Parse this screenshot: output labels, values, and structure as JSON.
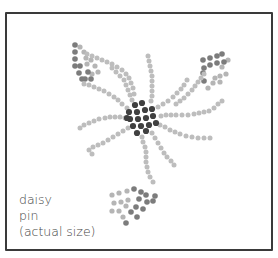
{
  "caption": {
    "line1": "daisy",
    "line2": "pin",
    "line3": "(actual size)"
  },
  "colors": {
    "border": "#3a3a3a",
    "center_bead": "#404040",
    "petal_bead": "#bdbdbd",
    "leaf_dark": "#7c7c7c",
    "leaf_light": "#b5b5b5",
    "text": "#444444"
  },
  "design": {
    "center": {
      "beads": [
        [
          135,
          105
        ],
        [
          142,
          103
        ],
        [
          129,
          112
        ],
        [
          137,
          112
        ],
        [
          145,
          110
        ],
        [
          152,
          109
        ],
        [
          130,
          119
        ],
        [
          138,
          119
        ],
        [
          146,
          118
        ],
        [
          153,
          116
        ],
        [
          133,
          126
        ],
        [
          141,
          126
        ],
        [
          149,
          125
        ],
        [
          156,
          123
        ],
        [
          137,
          133
        ],
        [
          146,
          131
        ],
        [
          127,
          118
        ]
      ]
    },
    "petals": [
      {
        "name": "petal-upper-left",
        "beads": [
          [
            127,
            108
          ],
          [
            122,
            104
          ],
          [
            118,
            100
          ],
          [
            114,
            97
          ],
          [
            109,
            94
          ],
          [
            104,
            91
          ],
          [
            99,
            89
          ],
          [
            94,
            87
          ],
          [
            89,
            85
          ],
          [
            84,
            84
          ]
        ]
      },
      {
        "name": "petal-left",
        "beads": [
          [
            125,
            118
          ],
          [
            120,
            117
          ],
          [
            115,
            117
          ],
          [
            110,
            117
          ],
          [
            105,
            118
          ],
          [
            99,
            119
          ],
          [
            94,
            121
          ],
          [
            89,
            123
          ],
          [
            84,
            125
          ],
          [
            80,
            128
          ]
        ]
      },
      {
        "name": "petal-lower-left",
        "beads": [
          [
            128,
            128
          ],
          [
            123,
            131
          ],
          [
            118,
            134
          ],
          [
            113,
            137
          ],
          [
            108,
            140
          ],
          [
            103,
            143
          ],
          [
            98,
            145
          ],
          [
            93,
            147
          ],
          [
            89,
            150
          ],
          [
            92,
            154
          ]
        ]
      },
      {
        "name": "petal-up-left",
        "beads": [
          [
            132,
            100
          ],
          [
            130,
            95
          ],
          [
            128,
            90
          ],
          [
            126,
            85
          ],
          [
            124,
            80
          ],
          [
            120,
            76
          ],
          [
            116,
            72
          ],
          [
            112,
            68
          ]
        ]
      },
      {
        "name": "petal-up",
        "beads": [
          [
            151,
            101
          ],
          [
            152,
            96
          ],
          [
            152,
            91
          ],
          [
            152,
            86
          ],
          [
            152,
            81
          ],
          [
            152,
            76
          ],
          [
            151,
            71
          ],
          [
            150,
            66
          ],
          [
            149,
            61
          ],
          [
            148,
            56
          ]
        ]
      },
      {
        "name": "petal-up-right",
        "beads": [
          [
            158,
            107
          ],
          [
            163,
            104
          ],
          [
            168,
            101
          ],
          [
            173,
            97
          ],
          [
            177,
            93
          ],
          [
            181,
            89
          ],
          [
            184,
            85
          ],
          [
            187,
            80
          ]
        ]
      },
      {
        "name": "petal-right",
        "beads": [
          [
            161,
            116
          ],
          [
            166,
            115
          ],
          [
            171,
            115
          ],
          [
            176,
            115
          ],
          [
            182,
            115
          ],
          [
            188,
            115
          ],
          [
            194,
            114
          ],
          [
            199,
            113
          ],
          [
            204,
            112
          ],
          [
            209,
            111
          ],
          [
            214,
            108
          ],
          [
            218,
            104
          ],
          [
            222,
            101
          ]
        ]
      },
      {
        "name": "petal-lower-right",
        "beads": [
          [
            160,
            125
          ],
          [
            165,
            127
          ],
          [
            170,
            130
          ],
          [
            175,
            132
          ],
          [
            180,
            134
          ],
          [
            186,
            136
          ],
          [
            192,
            137
          ],
          [
            198,
            138
          ],
          [
            204,
            138
          ],
          [
            210,
            138
          ]
        ]
      },
      {
        "name": "petal-down-right",
        "beads": [
          [
            152,
            133
          ],
          [
            155,
            138
          ],
          [
            158,
            143
          ],
          [
            161,
            148
          ],
          [
            164,
            153
          ],
          [
            167,
            157
          ],
          [
            171,
            161
          ],
          [
            174,
            165
          ]
        ]
      },
      {
        "name": "petal-down",
        "beads": [
          [
            142,
            137
          ],
          [
            143,
            142
          ],
          [
            145,
            147
          ],
          [
            146,
            152
          ],
          [
            146,
            157
          ],
          [
            146,
            162
          ],
          [
            147,
            167
          ],
          [
            148,
            172
          ],
          [
            150,
            177
          ],
          [
            153,
            182
          ]
        ]
      },
      {
        "name": "petal-top-left-arc",
        "beads": [
          [
            87,
            54
          ],
          [
            92,
            56
          ],
          [
            97,
            58
          ],
          [
            102,
            60
          ],
          [
            107,
            62
          ],
          [
            112,
            64
          ],
          [
            117,
            67
          ],
          [
            122,
            70
          ],
          [
            126,
            74
          ],
          [
            129,
            78
          ],
          [
            131,
            83
          ],
          [
            133,
            88
          ],
          [
            134,
            94
          ]
        ]
      },
      {
        "name": "petal-up-right-arc",
        "beads": [
          [
            176,
            104
          ],
          [
            180,
            101
          ],
          [
            184,
            98
          ],
          [
            188,
            94
          ],
          [
            192,
            90
          ],
          [
            195,
            86
          ],
          [
            198,
            82
          ],
          [
            201,
            78
          ],
          [
            204,
            74
          ]
        ]
      }
    ],
    "leaves": [
      {
        "name": "leaf-top-left",
        "dark": [
          [
            75,
            45
          ],
          [
            75,
            52
          ],
          [
            75,
            59
          ],
          [
            75,
            66
          ],
          [
            79,
            73
          ],
          [
            82,
            79
          ],
          [
            85,
            79
          ],
          [
            91,
            79
          ],
          [
            88,
            72
          ],
          [
            80,
            66
          ]
        ],
        "light": [
          [
            80,
            47
          ],
          [
            84,
            52
          ],
          [
            86,
            58
          ],
          [
            91,
            60
          ],
          [
            87,
            64
          ],
          [
            95,
            66
          ],
          [
            98,
            72
          ],
          [
            92,
            74
          ]
        ]
      },
      {
        "name": "leaf-top-right",
        "dark": [
          [
            203,
            60
          ],
          [
            210,
            58
          ],
          [
            217,
            56
          ],
          [
            222,
            54
          ],
          [
            224,
            62
          ],
          [
            217,
            63
          ],
          [
            210,
            65
          ],
          [
            204,
            68
          ],
          [
            203,
            73
          ],
          [
            204,
            81
          ]
        ],
        "light": [
          [
            228,
            60
          ],
          [
            222,
            67
          ],
          [
            226,
            74
          ],
          [
            220,
            76
          ],
          [
            215,
            78
          ],
          [
            213,
            83
          ],
          [
            220,
            82
          ],
          [
            208,
            88
          ]
        ]
      },
      {
        "name": "leaf-bottom",
        "dark": [
          [
            134,
            189
          ],
          [
            141,
            192
          ],
          [
            146,
            195
          ],
          [
            139,
            199
          ],
          [
            147,
            202
          ],
          [
            153,
            201
          ],
          [
            155,
            196
          ],
          [
            136,
            207
          ],
          [
            143,
            209
          ],
          [
            131,
            212
          ],
          [
            126,
            223
          ],
          [
            137,
            217
          ]
        ],
        "light": [
          [
            112,
            195
          ],
          [
            119,
            193
          ],
          [
            127,
            191
          ],
          [
            114,
            203
          ],
          [
            121,
            202
          ],
          [
            128,
            200
          ],
          [
            112,
            211
          ],
          [
            119,
            211
          ],
          [
            123,
            217
          ],
          [
            126,
            206
          ]
        ]
      }
    ]
  }
}
